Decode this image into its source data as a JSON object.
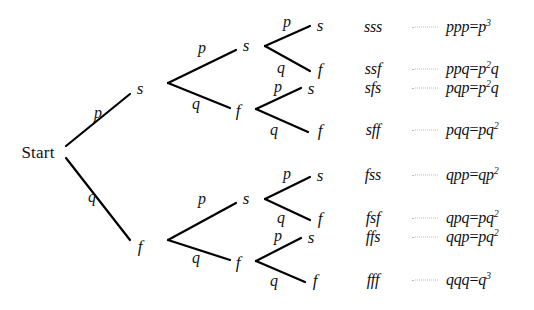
{
  "diagram": {
    "root_label": "Start",
    "branch_labels": {
      "success": "p",
      "failure": "q"
    },
    "node_labels": {
      "success": "s",
      "failure": "f"
    }
  },
  "nodes": [
    {
      "id": "start",
      "label": "Start",
      "x": 38,
      "y": 152
    },
    {
      "id": "s1",
      "label": "s",
      "x": 140,
      "y": 88
    },
    {
      "id": "f1",
      "label": "f",
      "x": 140,
      "y": 246
    },
    {
      "id": "s2a",
      "label": "s",
      "x": 246,
      "y": 45
    },
    {
      "id": "f2a",
      "label": "f",
      "x": 238,
      "y": 110
    },
    {
      "id": "s2b",
      "label": "s",
      "x": 246,
      "y": 198
    },
    {
      "id": "f2b",
      "label": "f",
      "x": 238,
      "y": 262
    },
    {
      "id": "t1",
      "label": "s",
      "x": 320,
      "y": 25
    },
    {
      "id": "t2",
      "label": "f",
      "x": 320,
      "y": 69
    },
    {
      "id": "t3",
      "label": "s",
      "x": 311,
      "y": 88
    },
    {
      "id": "t4",
      "label": "f",
      "x": 320,
      "y": 130
    },
    {
      "id": "t5",
      "label": "s",
      "x": 320,
      "y": 175
    },
    {
      "id": "t6",
      "label": "f",
      "x": 320,
      "y": 218
    },
    {
      "id": "t7",
      "label": "s",
      "x": 311,
      "y": 237
    },
    {
      "id": "t8",
      "label": "f",
      "x": 315,
      "y": 280
    }
  ],
  "edges": [
    {
      "id": "e-start-s1",
      "label": "p",
      "lx": 98,
      "ly": 113,
      "x1": 66,
      "y1": 146,
      "x2": 130,
      "y2": 94
    },
    {
      "id": "e-start-f1",
      "label": "q",
      "lx": 92,
      "ly": 197,
      "x1": 66,
      "y1": 158,
      "x2": 130,
      "y2": 240
    },
    {
      "id": "e-s1-s2a",
      "label": "p",
      "lx": 202,
      "ly": 48,
      "x1": 168,
      "y1": 83,
      "x2": 236,
      "y2": 50
    },
    {
      "id": "e-s1-f2a",
      "label": "q",
      "lx": 196,
      "ly": 104,
      "x1": 168,
      "y1": 83,
      "x2": 230,
      "y2": 108
    },
    {
      "id": "e-s2a-t1",
      "label": "p",
      "lx": 287,
      "ly": 22,
      "x1": 265,
      "y1": 46,
      "x2": 310,
      "y2": 26
    },
    {
      "id": "e-s2a-t2",
      "label": "q",
      "lx": 281,
      "ly": 68,
      "x1": 265,
      "y1": 46,
      "x2": 310,
      "y2": 71
    },
    {
      "id": "e-f2a-t3",
      "label": "p",
      "lx": 278,
      "ly": 87,
      "x1": 256,
      "y1": 109,
      "x2": 301,
      "y2": 88
    },
    {
      "id": "e-f2a-t4",
      "label": "q",
      "lx": 274,
      "ly": 130,
      "x1": 256,
      "y1": 109,
      "x2": 308,
      "y2": 132
    },
    {
      "id": "e-f1-s2b",
      "label": "p",
      "lx": 202,
      "ly": 199,
      "x1": 168,
      "y1": 240,
      "x2": 236,
      "y2": 203
    },
    {
      "id": "e-f1-f2b",
      "label": "q",
      "lx": 196,
      "ly": 258,
      "x1": 168,
      "y1": 240,
      "x2": 230,
      "y2": 260
    },
    {
      "id": "e-s2b-t5",
      "label": "p",
      "lx": 287,
      "ly": 174,
      "x1": 265,
      "y1": 199,
      "x2": 310,
      "y2": 177
    },
    {
      "id": "e-s2b-t6",
      "label": "q",
      "lx": 281,
      "ly": 218,
      "x1": 265,
      "y1": 199,
      "x2": 310,
      "y2": 220
    },
    {
      "id": "e-f2b-t7",
      "label": "p",
      "lx": 278,
      "ly": 236,
      "x1": 256,
      "y1": 261,
      "x2": 301,
      "y2": 238
    },
    {
      "id": "e-f2b-t8",
      "label": "q",
      "lx": 274,
      "ly": 281,
      "x1": 256,
      "y1": 261,
      "x2": 305,
      "y2": 282
    }
  ],
  "rows": [
    {
      "outcome": "sss",
      "base": "ppp",
      "result": "p",
      "exp": "3",
      "factor": "",
      "y": 27
    },
    {
      "outcome": "ssf",
      "base": "ppq",
      "result": "p",
      "exp": "2",
      "factor": "q",
      "y": 69
    },
    {
      "outcome": "sfs",
      "base": "pqp",
      "result": "p",
      "exp": "2",
      "factor": "q",
      "y": 88
    },
    {
      "outcome": "sff",
      "base": "pqq",
      "result": "pq",
      "exp": "2",
      "factor": "",
      "y": 130
    },
    {
      "outcome": "fss",
      "base": "qpp",
      "result": "qp",
      "exp": "2",
      "factor": "",
      "y": 175
    },
    {
      "outcome": "fsf",
      "base": "qpq",
      "result": "pq",
      "exp": "2",
      "factor": "",
      "y": 218
    },
    {
      "outcome": "ffs",
      "base": "qqp",
      "result": "pq",
      "exp": "2",
      "factor": "",
      "y": 237
    },
    {
      "outcome": "fff",
      "base": "qqq",
      "result": "q",
      "exp": "3",
      "factor": "",
      "y": 280
    }
  ],
  "columns": {
    "outcome_x": 373,
    "leader_x": 412,
    "leader_width": 26,
    "expr_x": 446,
    "equals": "="
  },
  "style": {
    "line_color": "#000000",
    "text_color": "#111111",
    "leader_color": "#b9b9b9",
    "background": "#ffffff"
  }
}
